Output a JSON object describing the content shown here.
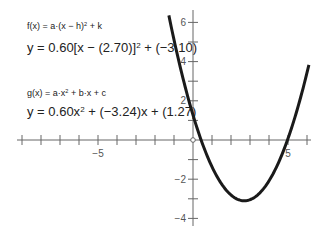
{
  "equations": {
    "f_general": "f(x) = a·(x−h)² + k",
    "f_specific": "y = 0.60[x − (2.70)]² + (−3.10)",
    "g_general": "g(x) = a·x² + b·x + c",
    "g_specific": "y = 0.60x² + (−3.24)x + (1.27)"
  },
  "eq_parts": {
    "f_general_a": "f(x) = a·(x − h)",
    "f_general_exp": "2",
    "f_general_b": " + k",
    "f_specific_a": "y = 0.60[x − (2.70)]",
    "f_specific_exp": "2",
    "f_specific_b": " + (−3.10)",
    "g_general_a": "g(x) = a·x",
    "g_general_exp": "2",
    "g_general_b": " + b·x + c",
    "g_specific_a": "y = 0.60x",
    "g_specific_exp": "2",
    "g_specific_b": " + (−3.24)x + (1.27)"
  },
  "axes": {
    "x_tick_labels": [
      {
        "value": -5,
        "label": "−5"
      },
      {
        "value": 5,
        "label": "5"
      }
    ],
    "y_tick_labels": [
      {
        "value": 6,
        "label": "6"
      },
      {
        "value": 4,
        "label": "4"
      },
      {
        "value": 2,
        "label": "2"
      },
      {
        "value": -2,
        "label": "−2"
      },
      {
        "value": -4,
        "label": "−4"
      }
    ]
  },
  "colors": {
    "curve": "#1a1a1a",
    "axis": "#666666",
    "text": "#222222"
  },
  "chart_data": {
    "type": "line",
    "title": "",
    "xlabel": "",
    "ylabel": "",
    "xlim": [
      -9.2,
      6.2
    ],
    "ylim": [
      -4.8,
      6.6
    ],
    "grid": false,
    "legend": [],
    "x_ticks": [
      -9,
      -8,
      -7,
      -6,
      -5,
      -4,
      -3,
      -2,
      -1,
      0,
      1,
      2,
      3,
      4,
      5,
      6
    ],
    "x_tick_labels": {
      "-5": "−5",
      "5": "5"
    },
    "y_ticks": [
      -4,
      -3,
      -2,
      -1,
      0,
      1,
      2,
      3,
      4,
      5,
      6
    ],
    "y_tick_labels": {
      "-4": "−4",
      "-2": "−2",
      "2": "2",
      "4": "4",
      "6": "6"
    },
    "series": [
      {
        "name": "y = 0.60(x − 2.70)² − 3.10",
        "a": 0.6,
        "h": 2.7,
        "k": -3.1,
        "b": -3.24,
        "c": 1.27,
        "x": [
          -1.27,
          -1.0,
          -0.5,
          0.0,
          0.5,
          1.0,
          1.5,
          2.0,
          2.7,
          3.0,
          3.5,
          4.0,
          4.5,
          5.0,
          5.5,
          6.1
        ],
        "y": [
          6.36,
          5.11,
          3.04,
          1.27,
          -0.2,
          -1.37,
          -2.24,
          -2.81,
          -3.1,
          -3.05,
          -2.72,
          -2.09,
          -1.16,
          0.07,
          1.6,
          3.84
        ]
      }
    ],
    "annotations": [
      {
        "type": "open-point",
        "x": 0,
        "y": 0
      },
      {
        "type": "text",
        "text": "f(x) = a·(x−h)² + k"
      },
      {
        "type": "text",
        "text": "y = 0.60[x − (2.70)]² + (−3.10)"
      },
      {
        "type": "text",
        "text": "g(x) = a·x² + b·x + c"
      },
      {
        "type": "text",
        "text": "y = 0.60x² + (−3.24)x + (1.27)"
      }
    ]
  }
}
